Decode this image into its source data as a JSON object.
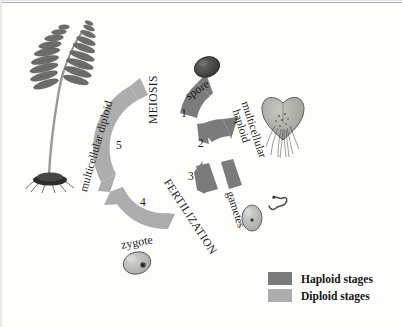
{
  "diagram": {
    "type": "life-cycle-diagram",
    "organism": "fern",
    "stage_labels": {
      "meiosis": "MEIOSIS",
      "fertilization": "FERTILIZATION",
      "spore": "spore",
      "gametes": "gametes",
      "zygote": "zygote",
      "multicellular_haploid": "multicellular\nhaploid",
      "multicellular_haploid_line1": "multicellular",
      "multicellular_haploid_line2": "haploid",
      "multicellular_diploid": "multicellular diploid"
    },
    "step_numbers": [
      "1",
      "2",
      "3",
      "4",
      "5"
    ],
    "steps": [
      {
        "number": "1",
        "phase": "haploid",
        "produces": "spore"
      },
      {
        "number": "2",
        "phase": "haploid",
        "produces": "multicellular haploid"
      },
      {
        "number": "3",
        "phase": "haploid",
        "produces": "gametes"
      },
      {
        "number": "4",
        "phase": "diploid",
        "produces": "zygote"
      },
      {
        "number": "5",
        "phase": "diploid",
        "produces": "multicellular diploid"
      }
    ],
    "illustrations": {
      "sporophyte": "fern-frond-illustration",
      "spore": "spore-illustration",
      "gametophyte": "heart-shaped-gametophyte-illustration",
      "egg": "egg-cell-illustration",
      "sperm": "sperm-cell-illustration",
      "zygote": "zygote-cell-illustration"
    }
  },
  "legend": {
    "items": [
      {
        "label": "Haploid stages",
        "color": "#7b7b7b",
        "phase": "haploid"
      },
      {
        "label": "Diploid stages",
        "color": "#adadad",
        "phase": "diploid"
      }
    ]
  },
  "colors": {
    "haploid": "#7b7b7b",
    "diploid": "#adadad",
    "text": "#1d1d1d",
    "background": "#fdfdfc"
  }
}
